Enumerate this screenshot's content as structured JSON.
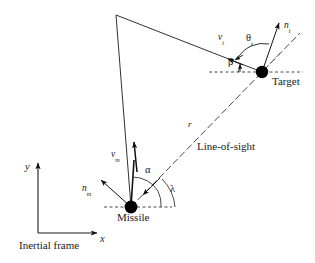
{
  "figure": {
    "background_color": "#ffffff",
    "line_color": "#1a1a1a",
    "marker_color": "#000000"
  },
  "labels": {
    "target_name": "Target",
    "missile_name": "Missile",
    "line_of_sight": "Line-of-sight",
    "inertial_frame": "Inertial frame",
    "range": "r",
    "axis_x": "x",
    "axis_y": "y",
    "target_velocity": "v",
    "target_velocity_sub": "t",
    "target_accel": "n",
    "target_accel_sub": "t",
    "missile_velocity": "v",
    "missile_velocity_sub": "m",
    "missile_accel": "n",
    "missile_accel_sub": "m",
    "angle_theta_t": "θ",
    "angle_theta_t_sub": "t",
    "angle_beta": "β",
    "angle_alpha": "α",
    "angle_lambda": "λ"
  },
  "geometry": {
    "missile_point": {
      "x": 131,
      "y": 207
    },
    "target_point": {
      "x": 262,
      "y": 72
    },
    "apex_point": {
      "x": 116,
      "y": 15
    },
    "origin_point": {
      "x": 38,
      "y": 233
    },
    "missile_heading_deg": 95,
    "target_heading_deg": 160,
    "los_angle_deg": 45.8,
    "missile_lead_angle_alpha_deg": 49,
    "target_aspect_angle_beta_deg": 20,
    "target_accel_angle_theta_t_deg": 70
  }
}
